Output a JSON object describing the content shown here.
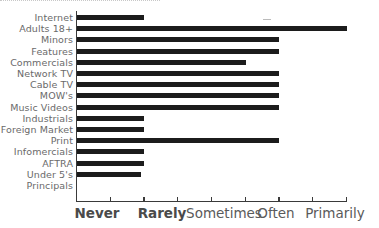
{
  "chart_data": {
    "type": "bar",
    "orientation": "horizontal",
    "title": "",
    "xlabel": "",
    "ylabel": "",
    "categories": [
      "Internet",
      "Adults 18+",
      "Minors",
      "Features",
      "Commercials",
      "Network TV",
      "Cable TV",
      "MOW's",
      "Music Videos",
      "Industrials",
      "Foreign Market",
      "Print",
      "Infomercials",
      "AFTRA",
      "Under 5's",
      "Principals"
    ],
    "values": [
      1.0,
      4.0,
      3.0,
      3.0,
      2.5,
      3.0,
      3.0,
      3.0,
      3.0,
      1.0,
      1.0,
      3.0,
      1.0,
      1.0,
      0.95,
      0
    ],
    "x_tick_labels": [
      "Never",
      "Rarely",
      "Sometimes",
      "Often",
      "Primarily"
    ],
    "x_tick_values": [
      0,
      1,
      2,
      3,
      4
    ],
    "xlim": [
      0,
      4
    ],
    "grid": false,
    "legend": null,
    "bar_color": "#1c1c1c"
  }
}
